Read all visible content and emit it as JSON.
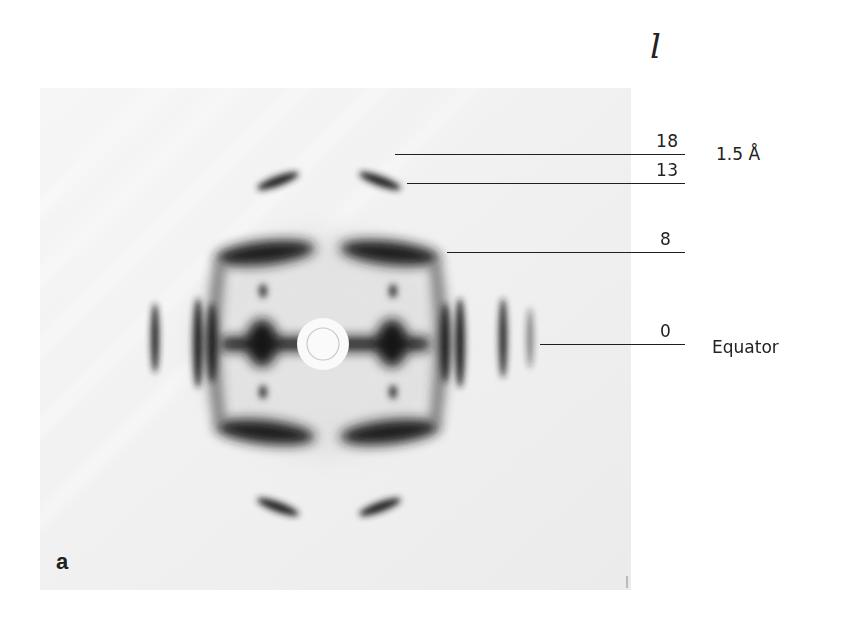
{
  "figure": {
    "panel_label": "a",
    "axis_symbol": "l",
    "layer_lines": [
      {
        "index": "18",
        "annotation": "1.5 Å"
      },
      {
        "index": "13",
        "annotation": ""
      },
      {
        "index": "8",
        "annotation": ""
      },
      {
        "index": "0",
        "annotation": "Equator"
      }
    ]
  },
  "colors": {
    "background": "#ffffff",
    "film": "#ececec",
    "reflection": "#1e1e1e",
    "line": "#1f1f1f"
  }
}
